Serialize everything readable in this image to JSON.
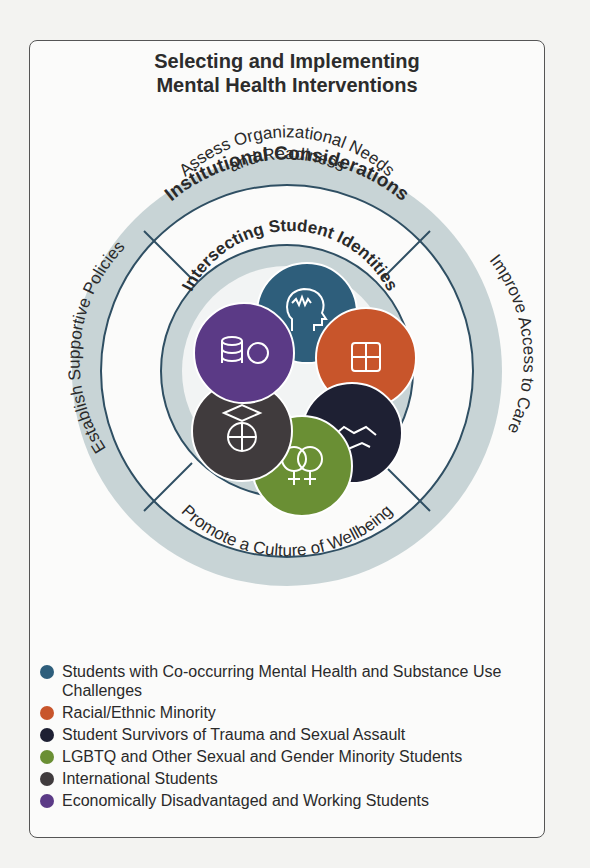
{
  "title": {
    "line1": "Selecting and Implementing",
    "line2": "Mental Health Interventions"
  },
  "outer_ring": {
    "label": "Institutional Considerations",
    "color": "#c8d4d6"
  },
  "segments": {
    "top": {
      "line1": "Assess Organizational Needs",
      "line2": "and Readiness"
    },
    "right": "Improve Access to Care",
    "bottom": "Promote a Culture of Wellbeing",
    "left": "Establish Supportive Policies"
  },
  "inner_ring": {
    "label": "Intersecting Student Identities"
  },
  "identity_circles": [
    {
      "name": "co-occurring",
      "icon": "head-brainwave-icon",
      "color": "#2e5e7b"
    },
    {
      "name": "racial-ethnic",
      "icon": "joined-hands-icon",
      "color": "#c8552b"
    },
    {
      "name": "trauma-survivors",
      "icon": "handshake-icon",
      "color": "#1e2033"
    },
    {
      "name": "lgbtq",
      "icon": "female-symbols-icon",
      "color": "#6a8f34"
    },
    {
      "name": "international",
      "icon": "graduation-globe-icon",
      "color": "#403b3d"
    },
    {
      "name": "economically-disadvantaged",
      "icon": "coins-icon",
      "color": "#5b3a86"
    }
  ],
  "legend": [
    {
      "label": "Students with Co-occurring Mental Health and Substance Use Challenges",
      "color": "#2e5e7b"
    },
    {
      "label": "Racial/Ethnic Minority",
      "color": "#c8552b"
    },
    {
      "label": "Student Survivors of Trauma and Sexual Assault",
      "color": "#1e2033"
    },
    {
      "label": "LGBTQ and Other Sexual and Gender Minority Students",
      "color": "#6a8f34"
    },
    {
      "label": "International Students",
      "color": "#403b3d"
    },
    {
      "label": "Economically Disadvantaged and Working Students",
      "color": "#5b3a86"
    }
  ]
}
